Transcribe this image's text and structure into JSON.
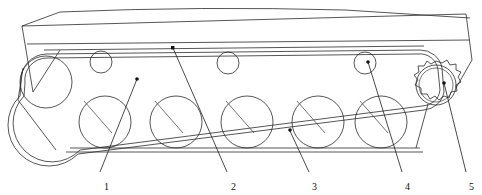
{
  "figure": {
    "type": "line-drawing",
    "width": 482,
    "height": 195,
    "background_color": "#ffffff",
    "line_color": "#2b2b2b"
  },
  "callouts": [
    {
      "id": "1",
      "label": "1",
      "text_x": 106,
      "text_y": 188,
      "leader": [
        [
          95,
          170
        ],
        [
          137,
          79
        ]
      ],
      "dot": [
        137,
        79
      ],
      "refers_to": "idler-wheel"
    },
    {
      "id": "2",
      "label": "2",
      "text_x": 232,
      "text_y": 188,
      "leader": [
        [
          222,
          170
        ],
        [
          173,
          48
        ]
      ],
      "dot": [
        173,
        48
      ],
      "refers_to": "track-upper-run"
    },
    {
      "id": "3",
      "label": "3",
      "text_x": 313,
      "text_y": 188,
      "leader": [
        [
          303,
          170
        ],
        [
          290,
          130
        ]
      ],
      "dot": [
        290,
        130
      ],
      "refers_to": "road-wheel"
    },
    {
      "id": "4",
      "label": "4",
      "text_x": 406,
      "text_y": 188,
      "leader": [
        [
          396,
          170
        ],
        [
          367,
          62
        ]
      ],
      "dot": [
        367,
        62
      ],
      "refers_to": "return-roller"
    },
    {
      "id": "5",
      "label": "5",
      "text_x": 470,
      "text_y": 188,
      "leader": [
        [
          462,
          170
        ],
        [
          443,
          82
        ]
      ],
      "dot": [
        443,
        82
      ],
      "refers_to": "drive-sprocket"
    }
  ],
  "hull": {
    "name": "vehicle-hull",
    "top_outline": [
      [
        22,
        26
      ],
      [
        60,
        13
      ],
      [
        190,
        8
      ],
      [
        340,
        10
      ],
      [
        466,
        14
      ],
      [
        470,
        20
      ]
    ],
    "body_outline": [
      [
        22,
        26
      ],
      [
        466,
        14
      ],
      [
        470,
        62
      ],
      [
        455,
        88
      ],
      [
        30,
        92
      ],
      [
        22,
        26
      ]
    ],
    "belt_line_y": 62
  },
  "idler_wheel": {
    "name": "idler-wheel",
    "cx": 46,
    "cy": 82,
    "r": 26
  },
  "drive_sprocket": {
    "name": "drive-sprocket",
    "cx": 436,
    "cy": 85,
    "r": 20,
    "teeth": 14,
    "tooth_depth": 6
  },
  "return_rollers": {
    "name": "return-roller",
    "r": 11,
    "centers": [
      [
        101,
        62
      ],
      [
        228,
        63
      ],
      [
        365,
        63
      ]
    ]
  },
  "road_wheels": {
    "name": "road-wheel",
    "r": 26,
    "centers": [
      [
        105,
        122
      ],
      [
        176,
        122
      ],
      [
        247,
        122
      ],
      [
        318,
        122
      ],
      [
        381,
        122
      ]
    ],
    "spoke_angle_deg": 215
  },
  "track": {
    "name": "track-belt",
    "upper_run": {
      "from": [
        46,
        56
      ],
      "to": [
        436,
        65
      ]
    },
    "lower_run": {
      "from": [
        60,
        150
      ],
      "to": [
        420,
        150
      ]
    },
    "band_offset": 3
  }
}
